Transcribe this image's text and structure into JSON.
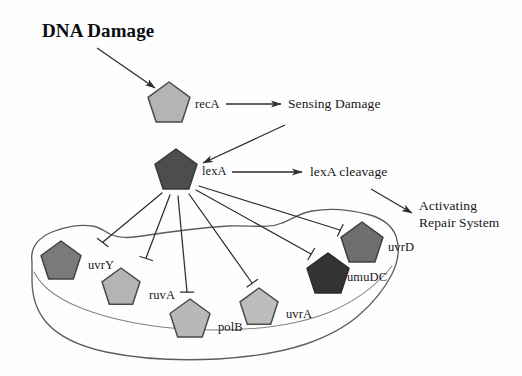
{
  "diagram": {
    "title_label": "DNA Damage",
    "process_labels": {
      "sensing": "Sensing Damage",
      "cleavage": "lexA cleavage",
      "activating": "Activating\nRepair System",
      "activating_line1": "Activating",
      "activating_line2": "Repair System"
    },
    "upstream_nodes": [
      {
        "id": "recA",
        "label": "recA",
        "fill": "#b4b4b4",
        "cx": 169,
        "cy": 104,
        "r": 22
      },
      {
        "id": "lexA",
        "label": "lexA",
        "fill": "#4d4d4d",
        "cx": 176,
        "cy": 171,
        "r": 22
      }
    ],
    "regulon_nodes": [
      {
        "id": "uvrY",
        "label": "uvrY",
        "fill": "#7a7a7a",
        "cx": 61,
        "cy": 262,
        "r": 21
      },
      {
        "id": "ruvA",
        "label": "ruvA",
        "fill": "#b4b4b4",
        "cx": 121,
        "cy": 288,
        "r": 20
      },
      {
        "id": "polB",
        "label": "polB",
        "fill": "#b8b8b8",
        "cx": 190,
        "cy": 320,
        "r": 21
      },
      {
        "id": "uvrA",
        "label": "uvrA",
        "fill": "#bdbdbd",
        "cx": 259,
        "cy": 308,
        "r": 20
      },
      {
        "id": "umuDC",
        "label": "umuDC",
        "fill": "#333333",
        "cx": 328,
        "cy": 275,
        "r": 22
      },
      {
        "id": "uvrD",
        "label": "uvrD",
        "fill": "#6e6e6e",
        "cx": 362,
        "cy": 244,
        "r": 22
      }
    ],
    "edges": [
      {
        "id": "damage-to-recA",
        "kind": "arrow",
        "from": "DNA Damage",
        "to": "recA"
      },
      {
        "id": "recA-to-sensing",
        "kind": "arrow",
        "from": "recA",
        "to": "Sensing Damage"
      },
      {
        "id": "sensing-to-lexA",
        "kind": "arrow",
        "from": "Sensing Damage",
        "to": "lexA"
      },
      {
        "id": "lexA-to-cleavage",
        "kind": "arrow",
        "from": "lexA",
        "to": "lexA cleavage"
      },
      {
        "id": "cleavage-to-activating",
        "kind": "arrow",
        "from": "lexA cleavage",
        "to": "Activating Repair System"
      },
      {
        "id": "lexA-inhibits-uvrY",
        "kind": "inhibition",
        "from": "lexA",
        "to": "uvrY"
      },
      {
        "id": "lexA-inhibits-ruvA",
        "kind": "inhibition",
        "from": "lexA",
        "to": "ruvA"
      },
      {
        "id": "lexA-inhibits-polB",
        "kind": "inhibition",
        "from": "lexA",
        "to": "polB"
      },
      {
        "id": "lexA-inhibits-uvrA",
        "kind": "inhibition",
        "from": "lexA",
        "to": "uvrA"
      },
      {
        "id": "lexA-inhibits-umuDC",
        "kind": "inhibition",
        "from": "lexA",
        "to": "umuDC"
      },
      {
        "id": "lexA-inhibits-uvrD",
        "kind": "inhibition",
        "from": "lexA",
        "to": "uvrD"
      }
    ],
    "enclosure": {
      "id": "sos-regulon-boundary",
      "stroke": "#5a5a5a"
    },
    "colors": {
      "stroke": "#3a3a3a",
      "node_outline": "#4a4a4a",
      "text": "#17171a",
      "background": "#ffffff"
    }
  }
}
